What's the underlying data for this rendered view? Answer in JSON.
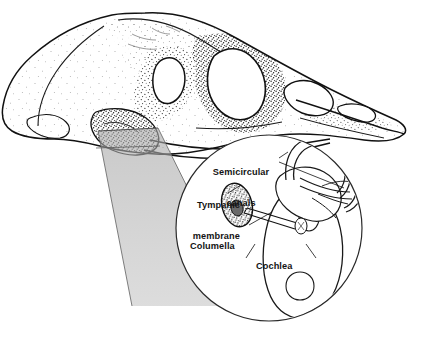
{
  "figure": {
    "width": 425,
    "height": 340,
    "background_color": "#ffffff",
    "ink_color": "#111111",
    "cone_fill_color": "#b4b4b4",
    "inset_fill_color": "#ffffff",
    "stipple_color": "#333333"
  },
  "skull": {
    "name": "bird-skull",
    "view": "lateral",
    "shading_style": "stipple",
    "regions": [
      {
        "name": "braincase",
        "label": ""
      },
      {
        "name": "orbit",
        "label": ""
      },
      {
        "name": "antorbital-fenestra",
        "label": ""
      },
      {
        "name": "temporal-fenestra",
        "label": ""
      },
      {
        "name": "upper-beak-rostrum",
        "label": ""
      },
      {
        "name": "lower-jaw-mandible",
        "label": ""
      },
      {
        "name": "quadrate-ear-region",
        "label": ""
      },
      {
        "name": "occipital-condyle",
        "label": ""
      }
    ]
  },
  "magnifier": {
    "name": "magnification-cone",
    "source_region": "quadrate-ear-region",
    "fill_color": "#b4b4b4",
    "opacity": 0.55
  },
  "inset": {
    "name": "ear-inset-circle",
    "shape": "circle",
    "center_x": 269,
    "center_y": 228,
    "radius": 93,
    "fill_color": "#ffffff",
    "stroke_color": "#2a2a2a",
    "structures": [
      {
        "key": "semicircular_canals",
        "label": "Semicircular\ncanals",
        "label_line1": "Semicircular",
        "label_line2": "canals",
        "align": "center"
      },
      {
        "key": "tympanic_membrane",
        "label": "Tympanic\nmembrane",
        "label_line1": "Tympanic",
        "label_line2": "membrane",
        "align": "right"
      },
      {
        "key": "columella",
        "label": "Columella",
        "label_line1": "Columella",
        "label_line2": "",
        "align": "left"
      },
      {
        "key": "cochlea",
        "label": "Cochlea",
        "label_line1": "Cochlea",
        "label_line2": "",
        "align": "left"
      }
    ]
  },
  "caption": {
    "text": ""
  }
}
